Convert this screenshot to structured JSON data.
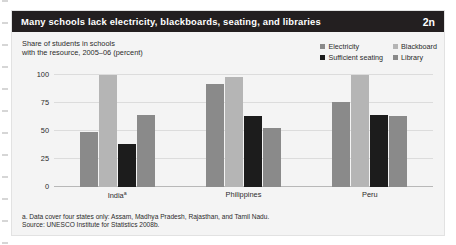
{
  "header": {
    "title": "Many schools lack electricity, blackboards, seating, and libraries",
    "figure_number": "2n"
  },
  "subtitle": {
    "line1": "Share of students in schools",
    "line2": "with the resource, 2005–06 (percent)"
  },
  "legend": {
    "items": [
      {
        "label": "Electricity",
        "color": "#8a8a8a"
      },
      {
        "label": "Blackboard",
        "color": "#b5b5b5"
      },
      {
        "label": "Sufficient seating",
        "color": "#1c1c1c"
      },
      {
        "label": "Library",
        "color": "#8a8a8a"
      }
    ]
  },
  "notes": {
    "footnote": "a. Data cover four states only: Assam, Madhya Pradesh, Rajasthan, and Tamil Nadu.",
    "source": "Source: UNESCO Institute for Statistics 2008b."
  },
  "colors": {
    "title_bar": "#231f20",
    "panel": "#f4f4f4",
    "gridline": "#dcdcdc",
    "electricity": "#8a8a8a",
    "blackboard": "#b5b5b5",
    "seating": "#1c1c1c",
    "library": "#8a8a8a"
  },
  "chart_data": {
    "type": "bar",
    "title": "Many schools lack electricity, blackboards, seating, and libraries",
    "subtitle": "Share of students in schools with the resource, 2005–06 (percent)",
    "xlabel": "",
    "ylabel": "percent",
    "ylim": [
      0,
      100
    ],
    "yticks": [
      0,
      25,
      50,
      75,
      100
    ],
    "ytick_labels": [
      "0",
      "25",
      "50",
      "75",
      "100"
    ],
    "grid": true,
    "legend_position": "top-right",
    "categories": [
      "Indiaᵃ",
      "Philippines",
      "Peru"
    ],
    "category_labels": [
      "India",
      "Philippines",
      "Peru"
    ],
    "category_footnote_markers": [
      "a",
      "",
      ""
    ],
    "series": [
      {
        "name": "Electricity",
        "color": "#8a8a8a",
        "values": [
          49,
          92,
          76
        ]
      },
      {
        "name": "Blackboard",
        "color": "#b5b5b5",
        "values": [
          100,
          98,
          100
        ]
      },
      {
        "name": "Sufficient seating",
        "color": "#1c1c1c",
        "values": [
          38,
          63,
          64
        ]
      },
      {
        "name": "Library",
        "color": "#8a8a8a",
        "values": [
          64,
          53,
          63
        ]
      }
    ]
  }
}
